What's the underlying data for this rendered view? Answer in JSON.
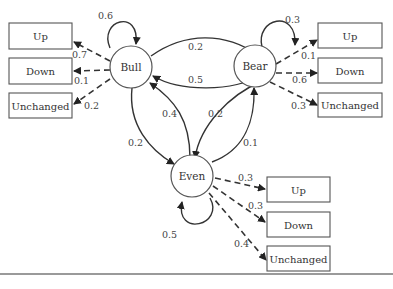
{
  "diagram": {
    "type": "hidden-markov-model",
    "states": [
      {
        "id": "bull",
        "label": "Bull"
      },
      {
        "id": "bear",
        "label": "Bear"
      },
      {
        "id": "even",
        "label": "Even"
      }
    ],
    "transitions": {
      "bull_bull": "0.6",
      "bull_bear": "0.2",
      "bear_bull": "0.5",
      "bull_even": "0.2",
      "even_bull": "0.4",
      "bear_bear": "0.3",
      "bear_even": "0.2",
      "even_bear": "0.1",
      "even_even": "0.5"
    },
    "emissions": {
      "bull": {
        "up": "0.7",
        "down": "0.1",
        "unchanged": "0.2"
      },
      "bear": {
        "up": "0.1",
        "down": "0.6",
        "unchanged": "0.3"
      },
      "even": {
        "up": "0.3",
        "down": "0.3",
        "unchanged": "0.4"
      }
    },
    "observations": {
      "up": "Up",
      "down": "Down",
      "unchanged": "Unchanged"
    }
  }
}
